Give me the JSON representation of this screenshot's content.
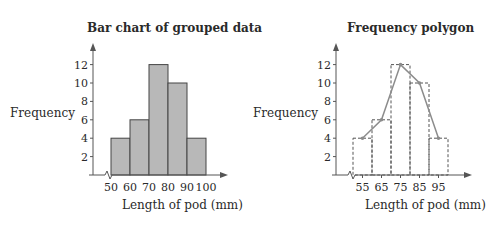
{
  "chart_data": [
    {
      "type": "bar",
      "title": "Bar chart of grouped data",
      "xlabel": "Length of pod (mm)",
      "ylabel": "Frequency",
      "categories": [
        "50-60",
        "60-70",
        "70-80",
        "80-90",
        "90-100"
      ],
      "bin_edges": [
        50,
        60,
        70,
        80,
        90,
        100
      ],
      "values": [
        4,
        6,
        12,
        10,
        4
      ],
      "x_tick_labels": [
        "50",
        "60",
        "70",
        "80",
        "90",
        "100"
      ],
      "y_tick_labels": [
        "2",
        "4",
        "6",
        "8",
        "10",
        "12"
      ],
      "ylim": [
        0,
        14
      ],
      "grid": false,
      "axis_break": true,
      "bar_color": "#b8b8b8"
    },
    {
      "type": "line",
      "title": "Frequency polygon",
      "xlabel": "Length of pod (mm)",
      "ylabel": "Frequency",
      "x": [
        55,
        65,
        75,
        85,
        95
      ],
      "values": [
        4,
        6,
        12,
        10,
        4
      ],
      "background_bars": {
        "style": "dashed outline",
        "bin_edges": [
          50,
          60,
          70,
          80,
          90,
          100
        ],
        "values": [
          4,
          6,
          12,
          10,
          4
        ]
      },
      "x_tick_labels": [
        "55",
        "65",
        "75",
        "85",
        "95"
      ],
      "y_tick_labels": [
        "2",
        "4",
        "6",
        "8",
        "10",
        "12"
      ],
      "ylim": [
        0,
        14
      ],
      "grid": false,
      "axis_break": true,
      "line_color": "#8c8c8c"
    }
  ],
  "left": {
    "title": "Bar chart of grouped data",
    "ylabel": "Frequency",
    "xlabel": "Length of pod (mm)"
  },
  "right": {
    "title": "Frequency polygon",
    "ylabel": "Frequency",
    "xlabel": "Length of pod (mm)"
  }
}
